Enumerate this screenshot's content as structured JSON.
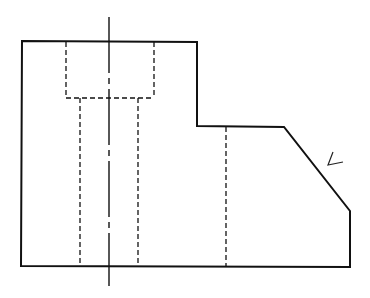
{
  "diagram": {
    "type": "orthographic-view",
    "stroke_color": "#111111",
    "background": "#ffffff",
    "outline_points": "22,41 197,42 197,126 284,127 350,211 350,267 21,266",
    "counterbore": {
      "x1": 66,
      "x2": 154,
      "top": 41,
      "bottom": 98
    },
    "through_hole": {
      "x1": 80,
      "x2": 138,
      "top": 98,
      "bottom": 266
    },
    "hidden_edge_x": 226,
    "centerline": {
      "x": 109,
      "top": 17,
      "bottom": 286
    },
    "direction_mark": "333,152 328,165 343,162"
  }
}
